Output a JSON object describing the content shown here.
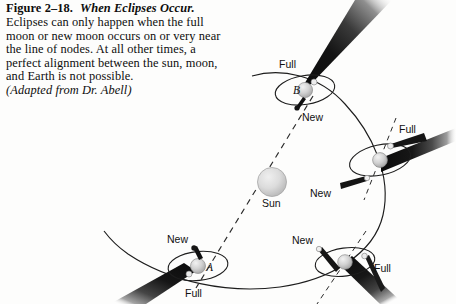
{
  "figure": {
    "number": "Figure 2–18.",
    "title": "When Eclipses Occur.",
    "body": "Eclipses can only happen when the full moon or new moon occurs on or very near the line of nodes. At all other times, a perfect alignment between the sun, moon, and Earth is not possible.",
    "source": "(Adapted from Dr. Abell)"
  },
  "diagram": {
    "sun_label": "Sun",
    "earth_a_label": "A",
    "earth_b_label": "B",
    "positions": [
      {
        "id": "earth-b",
        "marker": "B",
        "full_label": "Full",
        "new_label": "New",
        "eclipse_possible": true
      },
      {
        "id": "earth-right",
        "marker": "",
        "full_label": "Full",
        "new_label": "New",
        "eclipse_possible": false
      },
      {
        "id": "earth-bottom-right",
        "marker": "",
        "full_label": "Full",
        "new_label": "New",
        "eclipse_possible": false
      },
      {
        "id": "earth-a",
        "marker": "A",
        "full_label": "Full",
        "new_label": "New",
        "eclipse_possible": true
      }
    ],
    "colors": {
      "background": "#fdfdfc",
      "ink": "#111111",
      "sun_fill": "#d8d8d8",
      "earth_fill": "#d5d5d5",
      "shadow_dark": "#101010",
      "orbit_line": "#1a1a1a"
    }
  }
}
